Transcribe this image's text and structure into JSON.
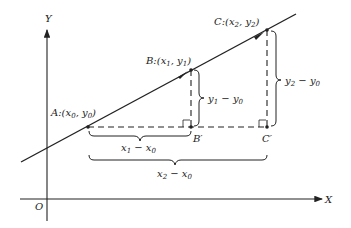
{
  "diagram": {
    "axes": {
      "x_label": "X",
      "y_label": "Y",
      "origin_label": "O"
    },
    "points": [
      {
        "name": "A",
        "coord_x": "x",
        "coord_x_sub": "0",
        "coord_y": "y",
        "coord_y_sub": "0"
      },
      {
        "name": "B",
        "coord_x": "x",
        "coord_x_sub": "1",
        "coord_y": "y",
        "coord_y_sub": "1"
      },
      {
        "name": "C",
        "coord_x": "x",
        "coord_x_sub": "2",
        "coord_y": "y",
        "coord_y_sub": "2"
      }
    ],
    "projections": [
      {
        "name": "B′"
      },
      {
        "name": "C′"
      }
    ],
    "braces": {
      "dx1": {
        "a": "x",
        "a_sub": "1",
        "op": " − ",
        "b": "x",
        "b_sub": "0"
      },
      "dx2": {
        "a": "x",
        "a_sub": "2",
        "op": " − ",
        "b": "x",
        "b_sub": "0"
      },
      "dy1": {
        "a": "y",
        "a_sub": "1",
        "op": " − ",
        "b": "y",
        "b_sub": "0"
      },
      "dy2": {
        "a": "y",
        "a_sub": "2",
        "op": " − ",
        "b": "y",
        "b_sub": "0"
      }
    },
    "colon": ":",
    "lparen": "(",
    "comma": ", ",
    "rparen": ")"
  }
}
